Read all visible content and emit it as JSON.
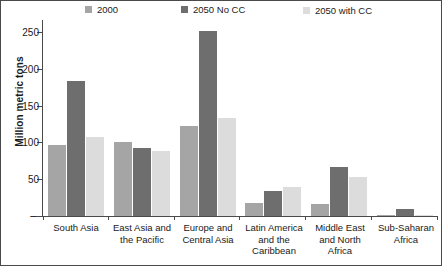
{
  "chart_data": {
    "type": "bar",
    "title": "",
    "subtitle": "",
    "xlabel": "",
    "ylabel": "Million metric tons",
    "ylim": [
      0,
      265
    ],
    "yticks": [
      0,
      50,
      100,
      150,
      200,
      250
    ],
    "ytick_labels": [
      "–",
      "50",
      "100",
      "150",
      "200",
      "250"
    ],
    "grid": false,
    "legend_position": "top",
    "orientation": "vertical",
    "grouping": "grouped",
    "categories": [
      "South Asia",
      "East Asia and the Pacific",
      "Europe and Central Asia",
      "Latin America and the Caribbean",
      "Middle East and North Africa",
      "Sub-Saharan Africa"
    ],
    "category_lines": [
      [
        "South Asia"
      ],
      [
        "East Asia and",
        "the Pacific"
      ],
      [
        "Europe and",
        "Central Asia"
      ],
      [
        "Latin America",
        "and the",
        "Caribbean"
      ],
      [
        "Middle East",
        "and North",
        "Africa"
      ],
      [
        "Sub-Saharan",
        "Africa"
      ]
    ],
    "series": [
      {
        "name": "2000",
        "color": "#a5a5a5",
        "values": [
          96,
          101,
          123,
          18,
          16,
          1
        ]
      },
      {
        "name": "2050 No CC",
        "color": "#6e6e6e",
        "values": [
          184,
          92,
          251,
          34,
          67,
          10
        ]
      },
      {
        "name": "2050 with CC",
        "color": "#dcdcdc",
        "values": [
          108,
          89,
          133,
          39,
          53,
          2
        ]
      }
    ]
  },
  "axis": {
    "y_title": "Million metric tons"
  },
  "colors": {
    "series_2000": "#a5a5a5",
    "series_2050_no_cc": "#6e6e6e",
    "series_2050_with_cc": "#dcdcdc",
    "axis": "#4a4a4a",
    "frame": "#4a4a4a",
    "text": "#1a1a1a",
    "background": "#ffffff"
  }
}
